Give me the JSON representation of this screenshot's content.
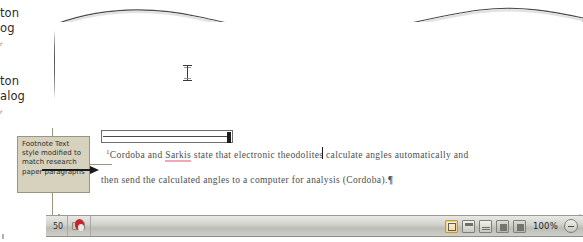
{
  "margin_text": {
    "fragment_1_line_1": "ton",
    "fragment_1_line_2": "og",
    "fragment_1_line_3": "r",
    "fragment_2_line_1": "ton",
    "fragment_2_line_2": "alog",
    "fragment_2_line_3": "r"
  },
  "callout": {
    "text": "Footnote Text style modified to match research paper paragraphs",
    "background_color": "#d6d2bd",
    "border_color": "#9a9580"
  },
  "document": {
    "footnote": {
      "marker": "1",
      "line_1_before": "Cordoba and ",
      "line_1_misspelled": "Sarkis",
      "line_1_after": " state that electronic  theodolites  calculate  angles  automatically  and",
      "line_2": "then send the calculated angles to a computer for analysis (Cordoba).",
      "pilcrow": "¶"
    },
    "cursor_icon": "i-beam-cursor"
  },
  "status_bar": {
    "page_count": "50",
    "proofing_icon": "proofing-errors-icon",
    "view_buttons": [
      {
        "name": "print-layout-view-button",
        "active": true
      },
      {
        "name": "full-screen-reading-view-button",
        "active": false
      },
      {
        "name": "web-layout-view-button",
        "active": false
      },
      {
        "name": "outline-view-button",
        "active": false
      },
      {
        "name": "draft-view-button",
        "active": false
      }
    ],
    "zoom_level": "100%",
    "zoom_out_icon": "zoom-out-minus-icon"
  }
}
